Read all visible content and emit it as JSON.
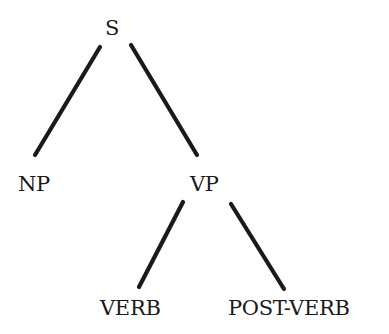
{
  "diagram": {
    "type": "syntax-tree",
    "nodes": {
      "s": {
        "label": "S",
        "x": 105,
        "y": 18
      },
      "np": {
        "label": "NP",
        "x": 18,
        "y": 174
      },
      "vp": {
        "label": "VP",
        "x": 190,
        "y": 174
      },
      "verb": {
        "label": "VERB",
        "x": 100,
        "y": 298
      },
      "postverb": {
        "label": "POST-VERB",
        "x": 228,
        "y": 298
      }
    },
    "edges": [
      {
        "from": "s",
        "to": "np",
        "x1": 100,
        "y1": 47,
        "x2": 35,
        "y2": 155
      },
      {
        "from": "s",
        "to": "vp",
        "x1": 131,
        "y1": 45,
        "x2": 197,
        "y2": 155
      },
      {
        "from": "vp",
        "to": "verb",
        "x1": 183,
        "y1": 202,
        "x2": 139,
        "y2": 287
      },
      {
        "from": "vp",
        "to": "postverb",
        "x1": 231,
        "y1": 204,
        "x2": 284,
        "y2": 289
      }
    ],
    "colors": {
      "ink": "#1a1a1a",
      "background": "#ffffff"
    }
  }
}
